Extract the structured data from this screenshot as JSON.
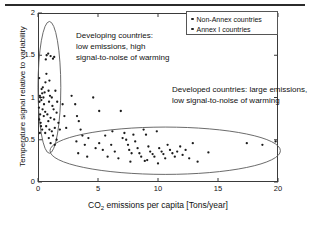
{
  "chart_data": {
    "type": "scatter",
    "title": "",
    "xlabel": "CO2 emissions per capita [Tons/year]",
    "xlabel_main": "CO",
    "xlabel_sub": "2",
    "xlabel_rest": " emissions per capita [Tons/year]",
    "ylabel": "Temperature signal relative to variability",
    "xlim": [
      0,
      20
    ],
    "ylim": [
      0,
      2
    ],
    "xticks": [
      "0",
      "5",
      "10",
      "15",
      "20"
    ],
    "xtick_values": [
      0,
      5,
      10,
      15,
      20
    ],
    "yticks": [
      "0",
      "0.5",
      "1",
      "1.5",
      "2"
    ],
    "ytick_values": [
      0,
      0.5,
      1,
      1.5,
      2
    ],
    "grid": false,
    "legend_position": "top-right",
    "legend": [
      {
        "label": "Non-Annex countries",
        "marker": "dot",
        "color": "#1b1b1b"
      },
      {
        "label": "Annex I countries",
        "marker": "dot",
        "color": "#1b1b1b"
      }
    ],
    "annotations": [
      {
        "id": "developing",
        "lines": [
          "Developing countries:",
          "low emissions, high",
          "signal-to-noise of warming"
        ],
        "text": "Developing countries: low emissions, high signal-to-noise of warming"
      },
      {
        "id": "developed",
        "lines": [
          "Developed countries:  large emissions,",
          "low signal-to-noise of warming"
        ],
        "text": "Developed countries: large emissions, low signal-to-noise of warming"
      }
    ],
    "ellipses": [
      {
        "id": "developing-ellipse",
        "cx": 0.95,
        "cy": 1.12,
        "rx": 0.95,
        "ry": 0.78,
        "rotation": 0
      },
      {
        "id": "developed-ellipse",
        "cx": 10.6,
        "cy": 0.37,
        "rx": 9.6,
        "ry": 0.28,
        "rotation": 0
      }
    ],
    "series": [
      {
        "name": "Non-Annex countries",
        "points": [
          [
            0.1,
            1.23
          ],
          [
            0.15,
            1.02
          ],
          [
            0.12,
            0.95
          ],
          [
            0.08,
            0.88
          ],
          [
            0.2,
            1.0
          ],
          [
            0.18,
            0.8
          ],
          [
            0.1,
            0.74
          ],
          [
            0.22,
            0.7
          ],
          [
            0.3,
            1.1
          ],
          [
            0.35,
            1.05
          ],
          [
            0.28,
            0.97
          ],
          [
            0.4,
            1.12
          ],
          [
            0.45,
            1.0
          ],
          [
            0.38,
            0.86
          ],
          [
            0.5,
            0.92
          ],
          [
            0.55,
            1.06
          ],
          [
            0.48,
            0.78
          ],
          [
            0.6,
            0.83
          ],
          [
            0.65,
            1.45
          ],
          [
            0.72,
            1.5
          ],
          [
            0.85,
            1.52
          ],
          [
            1.05,
            1.49
          ],
          [
            1.25,
            1.46
          ],
          [
            1.35,
            1.48
          ],
          [
            0.7,
            1.28
          ],
          [
            0.95,
            1.2
          ],
          [
            0.62,
            1.18
          ],
          [
            0.88,
            1.08
          ],
          [
            1.0,
            1.02
          ],
          [
            1.15,
            1.0
          ],
          [
            0.92,
            0.95
          ],
          [
            1.2,
            0.9
          ],
          [
            1.45,
            1.08
          ],
          [
            1.3,
            0.86
          ],
          [
            0.78,
            0.8
          ],
          [
            1.05,
            0.76
          ],
          [
            0.86,
            0.72
          ],
          [
            1.35,
            0.74
          ],
          [
            1.55,
            0.82
          ],
          [
            1.6,
            0.95
          ],
          [
            0.68,
            0.66
          ],
          [
            0.95,
            0.62
          ],
          [
            1.15,
            0.6
          ],
          [
            1.4,
            0.64
          ],
          [
            1.7,
            0.7
          ],
          [
            1.82,
            0.62
          ],
          [
            1.25,
            0.55
          ],
          [
            0.9,
            0.52
          ],
          [
            1.55,
            0.5
          ],
          [
            1.05,
            0.46
          ],
          [
            1.4,
            0.44
          ],
          [
            0.6,
            0.58
          ],
          [
            0.35,
            0.62
          ],
          [
            0.25,
            0.66
          ],
          [
            0.15,
            0.58
          ],
          [
            2.05,
            0.92
          ],
          [
            2.2,
            0.78
          ],
          [
            2.35,
            0.64
          ],
          [
            3.1,
            0.92
          ],
          [
            3.25,
            0.78
          ],
          [
            3.4,
            0.72
          ],
          [
            3.55,
            0.62
          ],
          [
            3.7,
            0.55
          ],
          [
            3.2,
            0.48
          ],
          [
            3.9,
            0.44
          ],
          [
            3.35,
            0.34
          ],
          [
            4.2,
            0.52
          ],
          [
            4.6,
            1.0
          ],
          [
            5.1,
            0.84
          ],
          [
            2.8,
            1.02
          ],
          [
            4.1,
            0.3
          ],
          [
            4.8,
            0.4
          ]
        ]
      },
      {
        "name": "Annex I countries",
        "points": [
          [
            5.1,
            0.46
          ],
          [
            5.4,
            0.38
          ],
          [
            5.8,
            0.3
          ],
          [
            6.1,
            0.44
          ],
          [
            6.4,
            0.36
          ],
          [
            6.7,
            0.28
          ],
          [
            6.9,
            0.84
          ],
          [
            7.05,
            0.52
          ],
          [
            7.2,
            0.58
          ],
          [
            7.35,
            0.5
          ],
          [
            7.5,
            0.44
          ],
          [
            7.6,
            0.38
          ],
          [
            7.8,
            0.34
          ],
          [
            7.95,
            0.56
          ],
          [
            8.1,
            0.48
          ],
          [
            8.3,
            0.4
          ],
          [
            8.45,
            0.34
          ],
          [
            8.6,
            0.3
          ],
          [
            8.8,
            0.62
          ],
          [
            9.0,
            0.56
          ],
          [
            9.2,
            0.42
          ],
          [
            9.35,
            0.36
          ],
          [
            9.55,
            0.33
          ],
          [
            9.7,
            0.3
          ],
          [
            9.9,
            0.6
          ],
          [
            10.1,
            0.4
          ],
          [
            10.3,
            0.36
          ],
          [
            10.45,
            0.33
          ],
          [
            10.6,
            0.28
          ],
          [
            10.8,
            0.44
          ],
          [
            11.0,
            0.38
          ],
          [
            11.2,
            0.34
          ],
          [
            11.4,
            0.3
          ],
          [
            11.6,
            0.36
          ],
          [
            11.85,
            0.42
          ],
          [
            12.05,
            0.32
          ],
          [
            12.3,
            0.38
          ],
          [
            12.6,
            0.28
          ],
          [
            12.9,
            0.46
          ],
          [
            13.3,
            0.24
          ],
          [
            14.2,
            0.35
          ],
          [
            17.4,
            0.46
          ],
          [
            18.7,
            0.44
          ],
          [
            19.8,
            0.48
          ],
          [
            6.2,
            0.6
          ],
          [
            5.6,
            0.55
          ],
          [
            8.9,
            0.25
          ],
          [
            10.0,
            0.22
          ],
          [
            7.7,
            0.24
          ],
          [
            9.1,
            0.26
          ]
        ]
      }
    ]
  }
}
